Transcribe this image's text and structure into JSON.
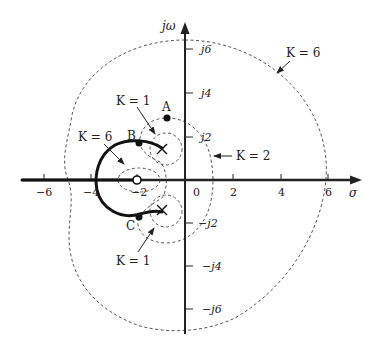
{
  "axes": {
    "x_label": "σ",
    "y_label": "jω",
    "x_ticks": [
      {
        "value": -6,
        "label": "−6"
      },
      {
        "value": -4,
        "label": "−4"
      },
      {
        "value": -2,
        "label": "−2"
      },
      {
        "value": 0,
        "label": "0"
      },
      {
        "value": 2,
        "label": "2"
      },
      {
        "value": 4,
        "label": "4"
      },
      {
        "value": 6,
        "label": "6"
      }
    ],
    "y_ticks": [
      {
        "value": 6,
        "label": "j6"
      },
      {
        "value": 4,
        "label": "j4"
      },
      {
        "value": 2,
        "label": "j2"
      },
      {
        "value": -2,
        "label": "−j2"
      },
      {
        "value": -4,
        "label": "−j4"
      },
      {
        "value": -6,
        "label": "−j6"
      }
    ]
  },
  "points": {
    "A": {
      "label": "A",
      "sigma": -0.8,
      "omega": 2.6
    },
    "B": {
      "label": "B",
      "sigma": -1.9,
      "omega": 1.6
    },
    "C": {
      "label": "C",
      "sigma": -1.9,
      "omega": -1.4
    }
  },
  "poles": [
    {
      "sigma": -1,
      "omega": 1.35
    },
    {
      "sigma": -1,
      "omega": -1.3
    }
  ],
  "zeros": [
    {
      "sigma": -2,
      "omega": 0
    }
  ],
  "contour_labels": {
    "k6_outer": "K = 6",
    "k6_inner": "K = 6",
    "k1_upper": "K = 1",
    "k1_lower": "K = 1",
    "k2": "K = 2"
  },
  "root_locus": {
    "description": "Thick arc from upper pole through B, around left crossing near σ≈−3.7, through C to lower pole; real axis to left of zero"
  }
}
